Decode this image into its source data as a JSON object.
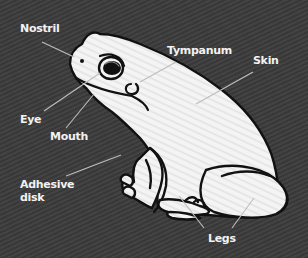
{
  "diagram": {
    "colors": {
      "background": "#3b3b3b",
      "frog_fill": "#f4f4f4",
      "outline": "#111111",
      "label_text": "#f2f2f2",
      "leader_line": "#bdbdbd"
    },
    "labels": [
      {
        "id": "nostril",
        "text": "Nostril"
      },
      {
        "id": "tympanum",
        "text": "Tympanum"
      },
      {
        "id": "skin",
        "text": "Skin"
      },
      {
        "id": "eye",
        "text": "Eye"
      },
      {
        "id": "mouth",
        "text": "Mouth"
      },
      {
        "id": "adhesive_disk",
        "text": "Adhesive\ndisk"
      },
      {
        "id": "legs",
        "text": "Legs"
      }
    ]
  }
}
